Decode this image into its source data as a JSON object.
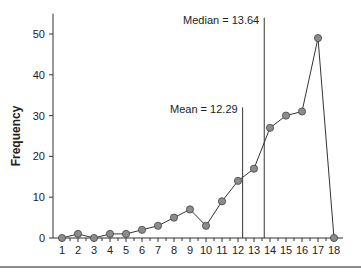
{
  "chart_data": {
    "type": "line",
    "title": "",
    "xlabel": "",
    "ylabel": "Frequency",
    "x": [
      1,
      2,
      3,
      4,
      5,
      6,
      7,
      8,
      9,
      10,
      11,
      12,
      13,
      14,
      15,
      16,
      17,
      18
    ],
    "series": [
      {
        "name": "Frequency",
        "values": [
          0,
          1,
          0,
          1,
          1,
          2,
          3,
          5,
          7,
          3,
          9,
          14,
          17,
          27,
          30,
          31,
          49,
          0
        ]
      }
    ],
    "xlim": [
      0.45,
      18.6
    ],
    "ylim": [
      0,
      55
    ],
    "yticks": [
      0,
      10,
      20,
      30,
      40,
      50
    ],
    "xticks": [
      1,
      2,
      3,
      4,
      5,
      6,
      7,
      8,
      9,
      10,
      11,
      12,
      13,
      14,
      15,
      16,
      17,
      18
    ],
    "grid": false,
    "legend": null,
    "reference_lines": [
      {
        "name": "Mean",
        "x": 12.29,
        "label": "Mean = 12.29",
        "top_value": 32
      },
      {
        "name": "Median",
        "x": 13.64,
        "label": "Median = 13.64",
        "top_value": 54
      }
    ],
    "colors": {
      "line": "#333333",
      "marker_fill": "#8c8c8c",
      "marker_stroke": "#444444",
      "axis": "#333333"
    }
  }
}
